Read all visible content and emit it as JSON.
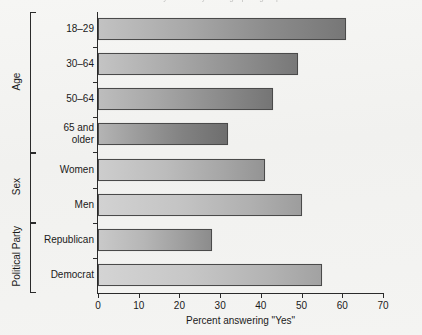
{
  "page": {
    "background_color": "#f3f3f1",
    "cut_off_title": "Survey results by demographic group"
  },
  "chart_data": {
    "type": "bar",
    "orientation": "horizontal",
    "title": "",
    "xlabel": "Percent answering \"Yes\"",
    "ylabel": "",
    "xlim": [
      0,
      70
    ],
    "xticks": [
      0,
      10,
      20,
      30,
      40,
      50,
      60,
      70
    ],
    "grid": false,
    "legend": null,
    "categories": [
      "18–29",
      "30–64",
      "50–64",
      "65 and\nolder",
      "Women",
      "Men",
      "Republican",
      "Democrat"
    ],
    "values": [
      61,
      49,
      43,
      32,
      41,
      50,
      28,
      55
    ],
    "groups": [
      {
        "name": "Age",
        "categories": [
          "18–29",
          "30–64",
          "50–64",
          "65 and\nolder"
        ]
      },
      {
        "name": "Sex",
        "categories": [
          "Women",
          "Men"
        ]
      },
      {
        "name": "Political Party",
        "categories": [
          "Republican",
          "Democrat"
        ]
      }
    ],
    "bar_style": {
      "fill": "grayscale-gradient",
      "border_color": "#4a4a4a"
    }
  },
  "axis": {
    "x_title": "Percent answering \"Yes\"",
    "tick_labels": [
      "0",
      "10",
      "20",
      "30",
      "40",
      "50",
      "60",
      "70"
    ]
  },
  "groups": {
    "age": "Age",
    "sex": "Sex",
    "party": "Political Party"
  },
  "bars": [
    {
      "label": "18–29",
      "value": 61,
      "group": "Age"
    },
    {
      "label": "30–64",
      "value": 49,
      "group": "Age"
    },
    {
      "label": "50–64",
      "value": 43,
      "group": "Age"
    },
    {
      "label": "65 and\nolder",
      "value": 32,
      "group": "Age"
    },
    {
      "label": "Women",
      "value": 41,
      "group": "Sex"
    },
    {
      "label": "Men",
      "value": 50,
      "group": "Sex"
    },
    {
      "label": "Republican",
      "value": 28,
      "group": "Political Party"
    },
    {
      "label": "Democrat",
      "value": 55,
      "group": "Political Party"
    }
  ]
}
